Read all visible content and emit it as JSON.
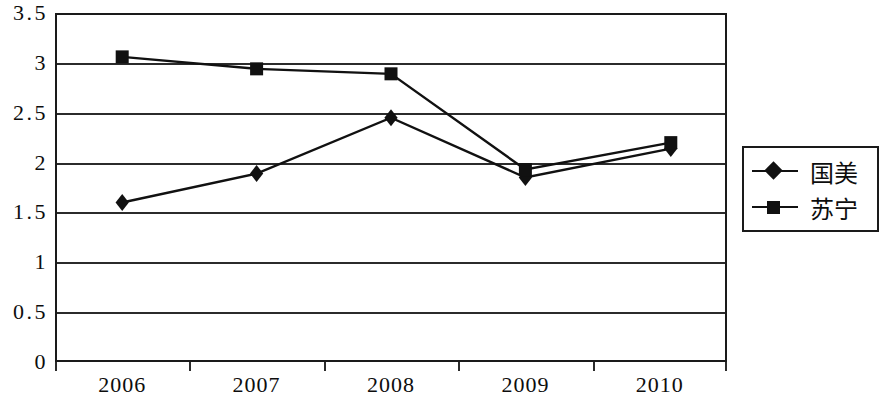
{
  "chart_data": {
    "type": "line",
    "title": "",
    "xlabel": "",
    "ylabel": "",
    "x": [
      "2006",
      "2007",
      "2008",
      "2009",
      "2010"
    ],
    "categories": [
      "2006",
      "2007",
      "2008",
      "2009",
      "2010"
    ],
    "ylim": [
      0,
      3.5
    ],
    "y_ticks": [
      "0",
      "0.5",
      "1",
      "1.5",
      "2",
      "2.5",
      "3",
      "3.5"
    ],
    "y_tick_values": [
      0,
      0.5,
      1,
      1.5,
      2,
      2.5,
      3,
      3.5
    ],
    "grid": true,
    "legend_position": "right",
    "series": [
      {
        "name": "国美",
        "marker": "diamond",
        "color": "#111111",
        "values": [
          1.6,
          1.89,
          2.45,
          1.85,
          2.14
        ]
      },
      {
        "name": "苏宁",
        "marker": "square",
        "color": "#111111",
        "values": [
          3.06,
          2.94,
          2.89,
          1.93,
          2.2
        ]
      }
    ]
  },
  "legend": {
    "items": [
      {
        "label": "国美",
        "marker": "diamond"
      },
      {
        "label": "苏宁",
        "marker": "square"
      }
    ]
  }
}
